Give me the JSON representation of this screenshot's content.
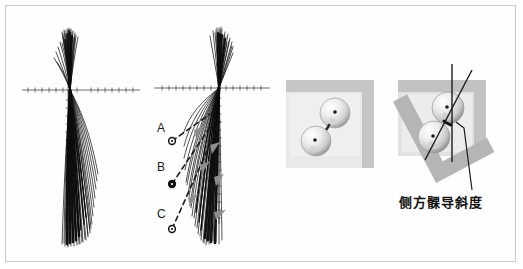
{
  "figure": {
    "title": "",
    "background_color": "#ffffff",
    "border_color": "#c9c9c9",
    "width": 523,
    "height": 269
  },
  "panels": [
    {
      "id": "pantograph-left",
      "name": "pantograph-tracing-left",
      "description": "Pantographic tracing bundle, left side",
      "axis": {
        "horizontal": true,
        "vertical": true,
        "tick_marks": true
      },
      "ink_color": "#141414"
    },
    {
      "id": "pantograph-right",
      "name": "pantograph-tracing-right",
      "description": "Pantographic tracing bundle, right side with labelled points",
      "axis": {
        "horizontal": true,
        "vertical": true,
        "tick_marks": true
      },
      "ink_color": "#141414"
    },
    {
      "id": "condyle-straight",
      "name": "condyle-spheres-neutral",
      "description": "Two condylar spheres against an L shaped frame in neutral position",
      "frame_color": "#c0c0c0",
      "field_color": "#e6e6e6"
    },
    {
      "id": "condyle-tilted",
      "name": "condyle-spheres-tilted",
      "description": "Two condylar spheres with tilted L shaped frame showing lateral condylar guidance angle",
      "frame_color": "#b9b9b9",
      "field_color": "#dcdcdc"
    }
  ],
  "point_labels": [
    {
      "id": "A",
      "text": "A",
      "marker": "circle-dot"
    },
    {
      "id": "B",
      "text": "B",
      "marker": "circle-dot"
    },
    {
      "id": "C",
      "text": "C",
      "marker": "circle-dot"
    }
  ],
  "caption": {
    "lateral_condylar_guidance": "侧方髁导斜度"
  },
  "colors": {
    "ink": "#141414",
    "frame_gray": "#bcbcbc",
    "field_gray": "#e4e4e4",
    "border_gray": "#c9c9c9",
    "sphere_light": "#fdfdfd",
    "sphere_mid": "#d6d6d6",
    "sphere_dark": "#9a9a9a"
  }
}
